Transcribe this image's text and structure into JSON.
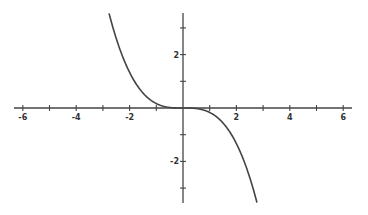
{
  "chart_data": {
    "type": "line",
    "title": "",
    "xlabel": "",
    "ylabel": "",
    "function": "y = -x^3/6",
    "xlim": [
      -6.5,
      6.4
    ],
    "ylim": [
      -3.6,
      3.6
    ],
    "grid": false,
    "legend": null,
    "x_ticks": [
      -6,
      -5,
      -4,
      -3,
      -2,
      -1,
      1,
      2,
      3,
      4,
      5,
      6
    ],
    "x_tick_labels": [
      "-6",
      "-4",
      "-2",
      "2",
      "4",
      "6"
    ],
    "x_tick_label_values": [
      -6,
      -4,
      -2,
      2,
      4,
      6
    ],
    "y_ticks": [
      -3,
      -2,
      -1,
      1,
      2,
      3
    ],
    "y_tick_labels": [
      "2",
      "-2"
    ],
    "y_tick_label_values": [
      2,
      -2
    ],
    "series": [
      {
        "name": "curve",
        "color": "#444444",
        "x": [
          -2.77,
          -2.5,
          -2.0,
          -1.5,
          -1.0,
          -0.5,
          0,
          0.5,
          1.0,
          1.5,
          2.0,
          2.5,
          2.77
        ],
        "y": [
          3.54,
          2.6,
          1.33,
          0.56,
          0.17,
          0.02,
          0,
          -0.02,
          -0.17,
          -0.56,
          -1.33,
          -2.6,
          -3.54
        ]
      }
    ]
  },
  "colors": {
    "axis": "#444444",
    "curve": "#444444",
    "background": "#ffffff"
  }
}
